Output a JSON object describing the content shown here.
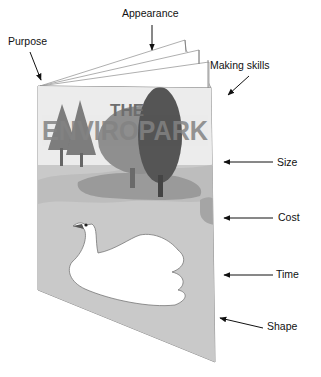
{
  "diagram": {
    "type": "labelled-illustration",
    "cover": {
      "title_line1": "THE",
      "title_line2": "ENVIROPARK",
      "scene": [
        "pine trees",
        "deciduous trees",
        "pond",
        "swan"
      ]
    },
    "labels": [
      {
        "id": "purpose",
        "text": "Purpose"
      },
      {
        "id": "appearance",
        "text": "Appearance"
      },
      {
        "id": "making_skills",
        "text": "Making skills"
      },
      {
        "id": "size",
        "text": "Size"
      },
      {
        "id": "cost",
        "text": "Cost"
      },
      {
        "id": "time",
        "text": "Time"
      },
      {
        "id": "shape",
        "text": "Shape"
      }
    ]
  },
  "colors": {
    "ink": "#111111",
    "cover_bg": "#e6e6e6",
    "water": "#bdbdbd",
    "tree_dark": "#5a5a5a",
    "tree_mid": "#8a8a8a",
    "title": "#7a7a7a"
  }
}
